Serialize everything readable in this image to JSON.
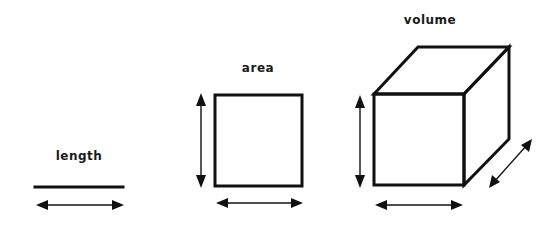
{
  "diagram": {
    "title": "",
    "background": "#ffffff",
    "ink_color": "#111111",
    "panels": [
      {
        "id": "length",
        "label": "length",
        "dimensions": 1,
        "shape": "line",
        "arrows": [
          "horizontal"
        ]
      },
      {
        "id": "area",
        "label": "area",
        "dimensions": 2,
        "shape": "square",
        "arrows": [
          "vertical",
          "horizontal"
        ]
      },
      {
        "id": "volume",
        "label": "volume",
        "dimensions": 3,
        "shape": "cube",
        "arrows": [
          "vertical",
          "horizontal",
          "depth"
        ]
      }
    ]
  }
}
